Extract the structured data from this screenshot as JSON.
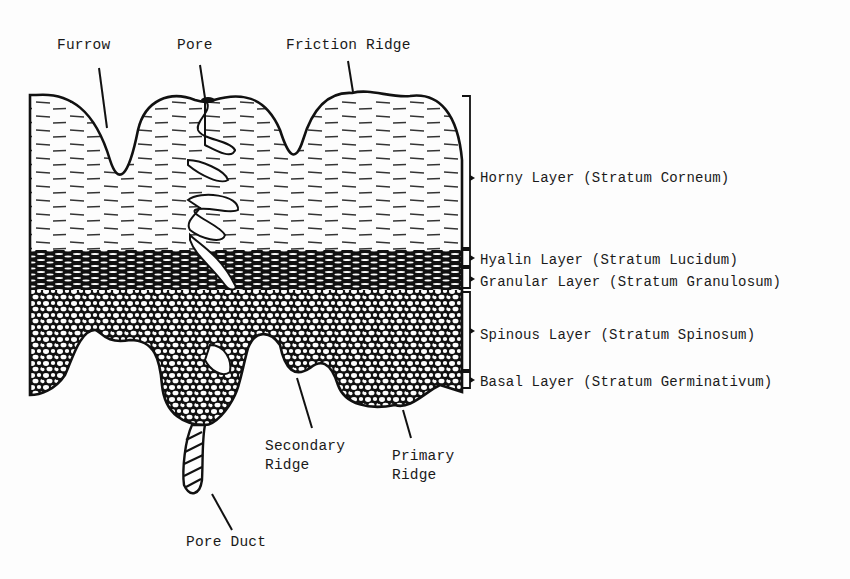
{
  "diagram": {
    "top_labels": {
      "furrow": "Furrow",
      "pore": "Pore",
      "friction_ridge": "Friction Ridge"
    },
    "layer_labels": [
      {
        "name": "Horny Layer",
        "latin": "(Stratum Corneum)"
      },
      {
        "name": "Hyalin Layer",
        "latin": "(Stratum Lucidum)"
      },
      {
        "name": "Granular Layer",
        "latin": "(Stratum Granulosum)"
      },
      {
        "name": "Spinous Layer",
        "latin": "(Stratum Spinosum)"
      },
      {
        "name": "Basal Layer",
        "latin": "(Stratum Germinativum)"
      }
    ],
    "bottom_labels": {
      "secondary_ridge_line1": "Secondary",
      "secondary_ridge_line2": "Ridge",
      "primary_ridge_line1": "Primary",
      "primary_ridge_line2": "Ridge",
      "pore_duct": "Pore Duct"
    },
    "colors": {
      "ink": "#111111",
      "paper": "#fdfdfd"
    }
  }
}
